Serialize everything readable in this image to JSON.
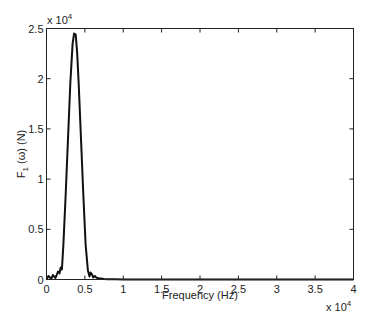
{
  "chart_data": {
    "type": "line",
    "title": "",
    "xlabel": "Frequency (Hz)",
    "ylabel": "F1 (ω) (N)",
    "ylabel_parts": {
      "main": "F",
      "sub": "1",
      "rest": " (ω) (N)"
    },
    "x_multiplier": "x 10",
    "x_exponent": "4",
    "y_multiplier": "x 10",
    "y_exponent": "4",
    "xlim": [
      0,
      40000
    ],
    "ylim": [
      0,
      25000
    ],
    "x_ticks": [
      0,
      0.5,
      1,
      1.5,
      2,
      2.5,
      3,
      3.5,
      4
    ],
    "x_tick_labels": [
      "0",
      "0.5",
      "1",
      "1.5",
      "2",
      "2.5",
      "3",
      "3.5",
      "4"
    ],
    "y_ticks": [
      0,
      0.5,
      1,
      1.5,
      2,
      2.5
    ],
    "y_tick_labels": [
      "0",
      "0.5",
      "1",
      "1.5",
      "2",
      "2.5"
    ],
    "grid": false,
    "legend": null,
    "series": [
      {
        "name": "F1(ω)",
        "color": "#111111",
        "x": [
          0,
          100,
          250,
          400,
          550,
          700,
          850,
          1000,
          1150,
          1300,
          1500,
          1700,
          1850,
          2000,
          2200,
          2500,
          2800,
          3100,
          3400,
          3600,
          3800,
          4000,
          4200,
          4500,
          4800,
          5100,
          5400,
          5600,
          5750,
          5900,
          6100,
          6300,
          6500,
          6800,
          7100,
          7500,
          8000,
          9000,
          10000,
          15000,
          20000,
          25000,
          30000,
          35000,
          40000
        ],
        "y": [
          0,
          150,
          350,
          250,
          80,
          200,
          450,
          300,
          150,
          400,
          800,
          600,
          1200,
          1000,
          3500,
          8500,
          14000,
          19500,
          23500,
          24500,
          24400,
          22500,
          19500,
          14000,
          8500,
          3500,
          900,
          300,
          700,
          550,
          200,
          350,
          180,
          120,
          90,
          50,
          30,
          20,
          10,
          5,
          3,
          2,
          2,
          1,
          0
        ]
      }
    ]
  }
}
